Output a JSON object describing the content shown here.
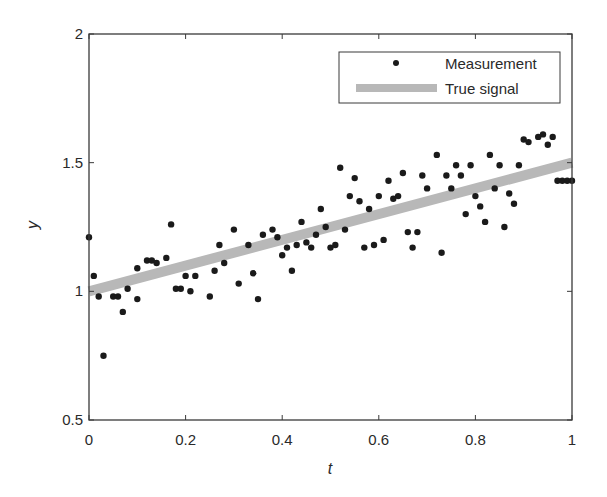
{
  "chart_data": {
    "type": "scatter",
    "title": "",
    "xlabel": "t",
    "ylabel": "y",
    "xlim": [
      0,
      1
    ],
    "ylim": [
      0.5,
      2
    ],
    "xticks": [
      0,
      0.2,
      0.4,
      0.6,
      0.8,
      1
    ],
    "xtick_labels": [
      "0",
      "0.2",
      "0.4",
      "0.6",
      "0.8",
      "1"
    ],
    "yticks": [
      0.5,
      1,
      1.5,
      2
    ],
    "ytick_labels": [
      "0.5",
      "1",
      "1.5",
      "2"
    ],
    "grid": false,
    "legend_position": "upper right",
    "legend": [
      {
        "label": "Measurement",
        "kind": "marker"
      },
      {
        "label": "True signal",
        "kind": "line"
      }
    ],
    "series": [
      {
        "name": "Measurement",
        "type": "scatter",
        "color": "#1a1a1a",
        "x": [
          0.0,
          0.01,
          0.02,
          0.03,
          0.05,
          0.06,
          0.07,
          0.08,
          0.1,
          0.1,
          0.12,
          0.13,
          0.14,
          0.16,
          0.17,
          0.18,
          0.19,
          0.2,
          0.21,
          0.22,
          0.25,
          0.26,
          0.27,
          0.28,
          0.3,
          0.31,
          0.33,
          0.34,
          0.35,
          0.36,
          0.38,
          0.39,
          0.4,
          0.41,
          0.42,
          0.43,
          0.44,
          0.45,
          0.46,
          0.47,
          0.48,
          0.49,
          0.5,
          0.51,
          0.52,
          0.53,
          0.54,
          0.55,
          0.56,
          0.57,
          0.58,
          0.59,
          0.6,
          0.61,
          0.62,
          0.63,
          0.64,
          0.65,
          0.66,
          0.67,
          0.68,
          0.69,
          0.7,
          0.72,
          0.73,
          0.74,
          0.75,
          0.76,
          0.77,
          0.78,
          0.79,
          0.8,
          0.81,
          0.82,
          0.83,
          0.84,
          0.85,
          0.86,
          0.87,
          0.88,
          0.89,
          0.9,
          0.91,
          0.93,
          0.94,
          0.95,
          0.96,
          0.97,
          0.98,
          0.99,
          1.0
        ],
        "y": [
          1.21,
          1.06,
          0.98,
          0.75,
          0.98,
          0.98,
          0.92,
          1.01,
          1.09,
          0.97,
          1.12,
          1.12,
          1.11,
          1.13,
          1.26,
          1.01,
          1.01,
          1.06,
          1.0,
          1.06,
          0.98,
          1.08,
          1.18,
          1.11,
          1.24,
          1.03,
          1.18,
          1.07,
          0.97,
          1.22,
          1.24,
          1.21,
          1.14,
          1.17,
          1.08,
          1.18,
          1.27,
          1.19,
          1.17,
          1.22,
          1.32,
          1.25,
          1.17,
          1.18,
          1.48,
          1.24,
          1.37,
          1.44,
          1.35,
          1.17,
          1.32,
          1.18,
          1.37,
          1.2,
          1.43,
          1.36,
          1.37,
          1.46,
          1.23,
          1.17,
          1.23,
          1.45,
          1.4,
          1.53,
          1.15,
          1.45,
          1.4,
          1.49,
          1.45,
          1.3,
          1.49,
          1.37,
          1.33,
          1.27,
          1.53,
          1.4,
          1.49,
          1.25,
          1.38,
          1.34,
          1.49,
          1.59,
          1.58,
          1.6,
          1.61,
          1.57,
          1.6,
          1.43,
          1.43,
          1.43,
          1.43
        ]
      },
      {
        "name": "True signal",
        "type": "line",
        "color": "#b8b8b8",
        "x": [
          0,
          1
        ],
        "y": [
          1.0,
          1.5
        ]
      }
    ]
  },
  "axes": {
    "xlabel": "t",
    "ylabel": "y",
    "xtick_labels": [
      "0",
      "0.2",
      "0.4",
      "0.6",
      "0.8",
      "1"
    ],
    "ytick_labels": [
      "0.5",
      "1",
      "1.5",
      "2"
    ]
  },
  "legend": {
    "items": [
      {
        "label": "Measurement"
      },
      {
        "label": "True signal"
      }
    ]
  }
}
